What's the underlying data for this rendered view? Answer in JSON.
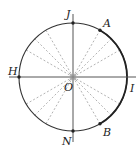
{
  "diagram": {
    "type": "unit-circle",
    "center": {
      "label": "O",
      "x": 73,
      "y": 77
    },
    "radius": 54,
    "points": [
      {
        "label": "J",
        "angle_deg": 90
      },
      {
        "label": "A",
        "angle_deg": 60
      },
      {
        "label": "H",
        "angle_deg": 180
      },
      {
        "label": "I",
        "angle_deg": 0
      },
      {
        "label": "B",
        "angle_deg": -60
      },
      {
        "label": "N",
        "angle_deg": 270
      }
    ],
    "dashed_ray_angles_deg": [
      30,
      45,
      60,
      120,
      135,
      150,
      210,
      225,
      240,
      300,
      315,
      330
    ],
    "highlighted_arc": {
      "from": "A",
      "through": "I",
      "to": "B"
    },
    "colors": {
      "line": "#222222",
      "dashed": "#aaaaaa",
      "arc": "#333333"
    }
  },
  "labels": {
    "J": "J",
    "A": "A",
    "H": "H",
    "O": "O",
    "I": "I",
    "B": "B",
    "N": "N"
  }
}
